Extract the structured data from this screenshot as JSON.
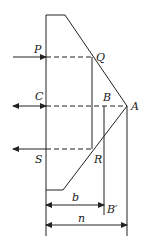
{
  "diagram": {
    "colors": {
      "stroke": "#222222",
      "background": "#ffffff"
    },
    "points": {
      "P": {
        "label": "P"
      },
      "Q": {
        "label": "Q"
      },
      "C": {
        "label": "C"
      },
      "B": {
        "label": "B"
      },
      "A": {
        "label": "A"
      },
      "S": {
        "label": "S"
      },
      "R": {
        "label": "R"
      },
      "B_prime": {
        "label": "B′"
      }
    },
    "dimensions": {
      "b": {
        "label": "b"
      },
      "n": {
        "label": "n"
      }
    }
  }
}
